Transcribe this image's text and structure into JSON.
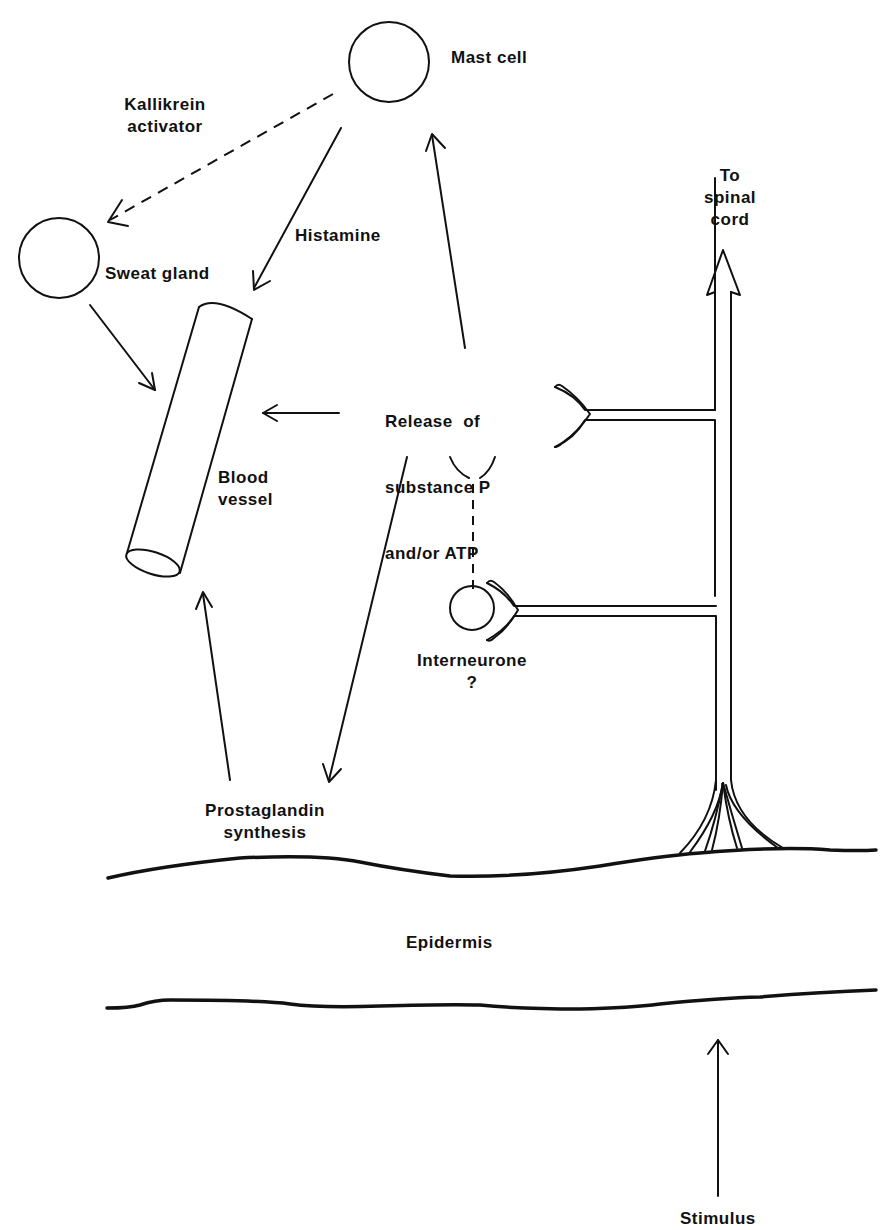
{
  "diagram": {
    "type": "physiological-pathway",
    "nodes": {
      "mast_cell": "Mast cell",
      "sweat_gland": "Sweat gland",
      "blood_vessel_line1": "Blood",
      "blood_vessel_line2": "vessel",
      "release_line1": "Release  of",
      "release_line2": "substance P",
      "release_line3": "and/or ATP",
      "interneurone_line1": "Interneurone",
      "interneurone_line2": "?",
      "prostaglandin_line1": "Prostaglandin",
      "prostaglandin_line2": "synthesis",
      "spinal_line1": "To",
      "spinal_line2": "spinal",
      "spinal_line3": "cord",
      "epidermis": "Epidermis",
      "stimulus": "Stimulus"
    },
    "edges": {
      "kallikrein_line1": "Kallikrein",
      "kallikrein_line2": "activator",
      "histamine": "Histamine"
    },
    "edge_list": [
      {
        "from": "Mast cell",
        "to": "Sweat gland",
        "label": "Kallikrein activator",
        "style": "dashed"
      },
      {
        "from": "Mast cell",
        "to": "Blood vessel",
        "label": "Histamine",
        "style": "solid"
      },
      {
        "from": "Sweat gland",
        "to": "Blood vessel",
        "style": "solid"
      },
      {
        "from": "Release of substance P and/or ATP",
        "to": "Mast cell",
        "style": "solid"
      },
      {
        "from": "Release of substance P and/or ATP",
        "to": "Blood vessel",
        "style": "solid"
      },
      {
        "from": "Release of substance P and/or ATP",
        "to": "Prostaglandin synthesis",
        "style": "solid"
      },
      {
        "from": "Prostaglandin synthesis",
        "to": "Blood vessel",
        "style": "solid"
      },
      {
        "from": "Interneurone",
        "to": "Release of substance P and/or ATP",
        "style": "dashed"
      },
      {
        "from": "Stimulus",
        "to": "Epidermis",
        "style": "solid"
      },
      {
        "from": "Nerve ending",
        "to": "To spinal cord",
        "style": "double-line"
      }
    ]
  }
}
